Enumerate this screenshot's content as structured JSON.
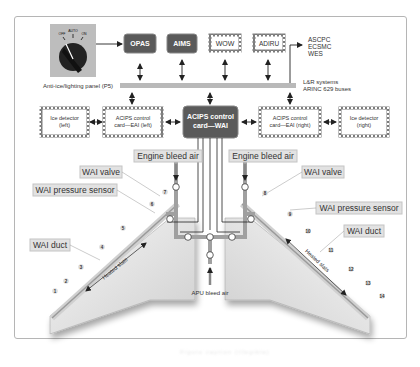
{
  "figure": {
    "selector_switch": {
      "positions": [
        "OFF",
        "AUTO",
        "ON"
      ],
      "selected": "AUTO"
    },
    "top_units": {
      "opas": "OPAS",
      "aims": "AIMS",
      "wow": "WOW",
      "adiru": "ADIRU"
    },
    "external_systems": [
      "ASCPC",
      "ECSMC",
      "WES"
    ],
    "panel_label": "Anti-ice/lighting panel (P5)",
    "bus_label_line1": "L&R systems",
    "bus_label_line2": "ARINC 629 buses",
    "middle_units": {
      "ice_detector_left_line1": "Ice detector",
      "ice_detector_left_line2": "(left)",
      "acips_eai_left_line1": "ACIPS control",
      "acips_eai_left_line2": "card—EAI (left)",
      "acips_wai_line1": "ACIPS control",
      "acips_wai_line2": "card—WAI",
      "acips_eai_right_line1": "ACIPS control",
      "acips_eai_right_line2": "card—EAI (right)",
      "ice_detector_right_line1": "Ice detector",
      "ice_detector_right_line2": "(right)"
    },
    "callouts": {
      "engine_bleed_left": "Engine bleed air",
      "engine_bleed_right": "Engine bleed air",
      "wai_valve_left": "WAI valve",
      "wai_valve_right": "WAI valve",
      "pressure_sensor_left": "WAI pressure sensor",
      "pressure_sensor_right": "WAI pressure sensor",
      "wai_duct_left": "WAI duct",
      "wai_duct_right": "WAI duct",
      "heated_slats_left": "Heated slats",
      "heated_slats_right": "Heated slats",
      "apu_bleed": "APU bleed air"
    },
    "slat_numbers_left": [
      "1",
      "2",
      "3",
      "4",
      "5",
      "6",
      "7"
    ],
    "slat_numbers_right": [
      "8",
      "9",
      "10",
      "11",
      "12",
      "13",
      "14"
    ],
    "caption": "Figure caption (illegible)"
  },
  "colors": {
    "dark_box": "#5a5a5a",
    "bus_bar": "#b9b9b9",
    "callout_fill": "#e2e2e2",
    "wing_fill": "#e8e8e8",
    "duct": "#9a9a9a",
    "frame_border": "#b5b5b5"
  }
}
